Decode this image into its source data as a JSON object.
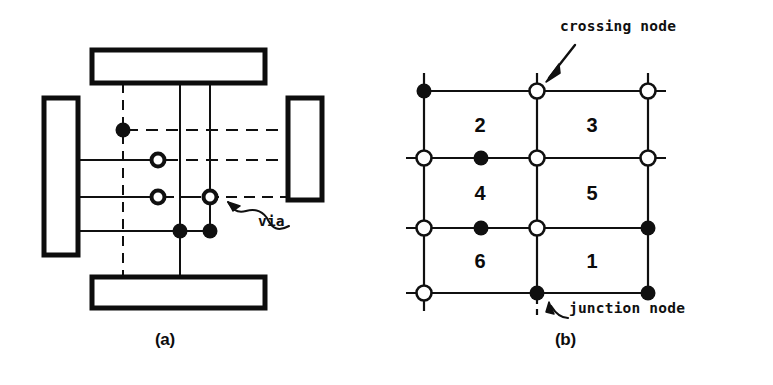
{
  "figure": {
    "panels": [
      {
        "id": "a",
        "caption": "(a)",
        "description": "detailed routing with vias"
      },
      {
        "id": "b",
        "caption": "(b)",
        "description": "grid graph with crossing and junction nodes"
      }
    ]
  },
  "panel_a": {
    "caption": "(a)",
    "annotation": {
      "label": "via",
      "target": "hollow-circle-node"
    },
    "pads": [
      {
        "name": "top-pad",
        "x": 92,
        "y": 50,
        "w": 173,
        "h": 33
      },
      {
        "name": "bottom-pad",
        "x": 92,
        "y": 277,
        "w": 173,
        "h": 31
      },
      {
        "name": "left-pad",
        "x": 44,
        "y": 98,
        "w": 34,
        "h": 157
      },
      {
        "name": "right-pad",
        "x": 288,
        "y": 98,
        "w": 34,
        "h": 102
      }
    ],
    "vertical_tracks": [
      {
        "name": "v-track-1",
        "x": 123,
        "style": "dashed",
        "y1": 83,
        "y2": 300
      },
      {
        "name": "v-track-2",
        "x": 180,
        "style": "solid",
        "y1": 83,
        "y2": 278
      },
      {
        "name": "v-track-3",
        "x": 210,
        "style": "solid",
        "y1": 83,
        "y2": 232
      }
    ],
    "horizontal_tracks": [
      {
        "name": "h-track-1",
        "y": 130,
        "style": "dashed",
        "x1": 126,
        "x2": 289
      },
      {
        "name": "h-track-2",
        "y": 160,
        "style": "mixed",
        "x1": 78,
        "x2": 289
      },
      {
        "name": "h-track-3",
        "y": 197,
        "style": "mixed",
        "x1": 78,
        "x2": 289
      },
      {
        "name": "h-track-4",
        "y": 231,
        "style": "solid",
        "x1": 78,
        "x2": 212
      }
    ],
    "nodes": [
      {
        "name": "junction-node",
        "kind": "filled",
        "x": 123,
        "y": 130
      },
      {
        "name": "via-node",
        "kind": "hollow",
        "x": 158,
        "y": 160
      },
      {
        "name": "via-node",
        "kind": "hollow",
        "x": 158,
        "y": 197
      },
      {
        "name": "via-node",
        "kind": "hollow",
        "x": 210,
        "y": 197
      },
      {
        "name": "junction-node",
        "kind": "filled",
        "x": 180,
        "y": 231
      },
      {
        "name": "junction-node",
        "kind": "filled",
        "x": 210,
        "y": 231
      }
    ]
  },
  "panel_b": {
    "caption": "(b)",
    "annotations": [
      {
        "name": "crossing-node-label",
        "label": "crossing node"
      },
      {
        "name": "junction-node-label",
        "label": "junction node"
      }
    ],
    "grid": {
      "columns_x": [
        424,
        537,
        648
      ],
      "rows_y": [
        91,
        158,
        228,
        293
      ],
      "stub": 18
    },
    "regions": [
      {
        "label": "2",
        "x": 480,
        "y": 125
      },
      {
        "label": "3",
        "x": 592,
        "y": 125
      },
      {
        "label": "4",
        "x": 480,
        "y": 193
      },
      {
        "label": "5",
        "x": 592,
        "y": 193
      },
      {
        "label": "6",
        "x": 480,
        "y": 261
      },
      {
        "label": "1",
        "x": 592,
        "y": 261
      }
    ],
    "nodes": [
      {
        "name": "junction-node",
        "kind": "filled",
        "x": 424,
        "y": 91
      },
      {
        "name": "crossing-node",
        "kind": "hollow",
        "x": 537,
        "y": 91
      },
      {
        "name": "crossing-node",
        "kind": "hollow",
        "x": 648,
        "y": 91
      },
      {
        "name": "crossing-node",
        "kind": "hollow",
        "x": 424,
        "y": 158
      },
      {
        "name": "junction-node",
        "kind": "filled",
        "x": 481,
        "y": 158
      },
      {
        "name": "crossing-node",
        "kind": "hollow",
        "x": 537,
        "y": 158
      },
      {
        "name": "crossing-node",
        "kind": "hollow",
        "x": 648,
        "y": 158
      },
      {
        "name": "crossing-node",
        "kind": "hollow",
        "x": 424,
        "y": 228
      },
      {
        "name": "junction-node",
        "kind": "filled",
        "x": 481,
        "y": 228
      },
      {
        "name": "crossing-node",
        "kind": "hollow",
        "x": 537,
        "y": 228
      },
      {
        "name": "junction-node",
        "kind": "filled",
        "x": 648,
        "y": 228
      },
      {
        "name": "crossing-node",
        "kind": "hollow",
        "x": 424,
        "y": 293
      },
      {
        "name": "junction-node",
        "kind": "filled",
        "x": 537,
        "y": 293
      },
      {
        "name": "junction-node",
        "kind": "filled",
        "x": 648,
        "y": 293
      }
    ]
  },
  "colors": {
    "ink": "#101010",
    "background": "#ffffff"
  }
}
